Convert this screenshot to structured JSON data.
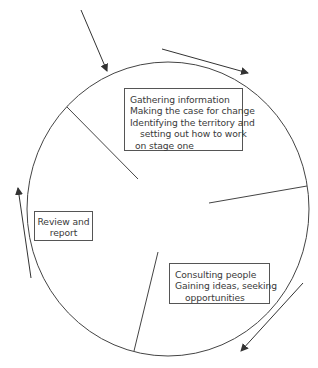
{
  "diagram": {
    "type": "cycle",
    "colors": {
      "stroke": "#444444",
      "text": "#3a3a3a",
      "background": "#ffffff"
    },
    "stages": [
      {
        "id": "stage-one",
        "lines": [
          "Gathering information",
          "Making the case for change",
          "Identifying the territory and",
          "setting out how to work",
          "on stage one"
        ]
      },
      {
        "id": "consulting",
        "lines": [
          "Consulting people",
          "Gaining ideas, seeking",
          "opportunities"
        ]
      },
      {
        "id": "review",
        "lines": [
          "Review and",
          "report"
        ]
      }
    ],
    "arrows": [
      {
        "name": "entry-arrow",
        "direction": "down-right"
      },
      {
        "name": "clockwise-top-arrow",
        "direction": "right"
      },
      {
        "name": "clockwise-bottom-right-arrow",
        "direction": "down-left"
      },
      {
        "name": "clockwise-left-arrow",
        "direction": "up"
      }
    ]
  }
}
